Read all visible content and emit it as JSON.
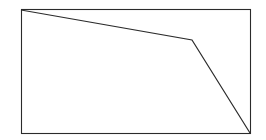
{
  "figure": {
    "canvas": {
      "width": 266,
      "height": 140,
      "background_color": "#ffffff"
    },
    "frame": {
      "name": "plot-border-rectangle",
      "x": 21,
      "y": 9,
      "width": 229,
      "height": 124,
      "stroke_color": "#2b2b2b",
      "stroke_width": 1.1,
      "fill_color": "#ffffff"
    },
    "polyline": {
      "name": "descending-polyline",
      "stroke_color": "#2b2b2b",
      "stroke_width": 1.2,
      "points_string": "21,10 192,40 250,133",
      "vertices": [
        {
          "label": "start-top-left",
          "x": 21,
          "y": 10
        },
        {
          "label": "bend-vertex",
          "x": 192,
          "y": 40
        },
        {
          "label": "end-bottom-right",
          "x": 250,
          "y": 133
        }
      ]
    }
  },
  "chart_data": {
    "type": "line",
    "title": "",
    "xlabel": "",
    "ylabel": "",
    "grid": false,
    "legend": "none",
    "axis_ticks": [],
    "xlim": [
      21,
      250
    ],
    "ylim": [
      9,
      133
    ],
    "series": [
      {
        "name": "descending-line",
        "color": "#2b2b2b",
        "x": [
          21,
          192,
          250
        ],
        "y": [
          10,
          40,
          133
        ]
      }
    ],
    "annotations": []
  }
}
